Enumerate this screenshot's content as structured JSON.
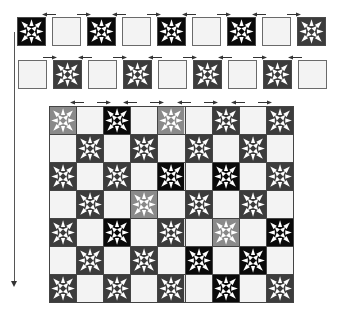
{
  "colors": {
    "black": "#0a0a0a",
    "dark": "#3c3c3c",
    "light": "#8a8a8a",
    "blank": "#f3f3f3",
    "star": "#ffffff",
    "arrow": "#333333"
  },
  "strip_row_1": {
    "top": 17,
    "blocks": [
      {
        "x": 17,
        "type": "star",
        "shade": "black"
      },
      {
        "x": 52,
        "type": "blank"
      },
      {
        "x": 87,
        "type": "star",
        "shade": "black"
      },
      {
        "x": 122,
        "type": "blank"
      },
      {
        "x": 157,
        "type": "star",
        "shade": "black"
      },
      {
        "x": 192,
        "type": "blank"
      },
      {
        "x": 227,
        "type": "star",
        "shade": "black"
      },
      {
        "x": 262,
        "type": "blank"
      },
      {
        "x": 297,
        "type": "star",
        "shade": "dark"
      }
    ],
    "arrows": [
      {
        "x": 42,
        "dir": "left"
      },
      {
        "x": 77,
        "dir": "right"
      },
      {
        "x": 112,
        "dir": "left"
      },
      {
        "x": 147,
        "dir": "right"
      },
      {
        "x": 182,
        "dir": "left"
      },
      {
        "x": 217,
        "dir": "right"
      },
      {
        "x": 252,
        "dir": "left"
      },
      {
        "x": 287,
        "dir": "right"
      }
    ],
    "arrow_top": 12
  },
  "strip_row_2": {
    "top": 60,
    "blocks": [
      {
        "x": 18,
        "type": "blank"
      },
      {
        "x": 53,
        "type": "star",
        "shade": "dark"
      },
      {
        "x": 88,
        "type": "blank"
      },
      {
        "x": 123,
        "type": "star",
        "shade": "dark"
      },
      {
        "x": 158,
        "type": "blank"
      },
      {
        "x": 193,
        "type": "star",
        "shade": "dark"
      },
      {
        "x": 228,
        "type": "blank"
      },
      {
        "x": 263,
        "type": "star",
        "shade": "dark"
      },
      {
        "x": 298,
        "type": "blank"
      }
    ],
    "arrows": [
      {
        "x": 43,
        "dir": "right"
      },
      {
        "x": 78,
        "dir": "left"
      },
      {
        "x": 113,
        "dir": "right"
      },
      {
        "x": 148,
        "dir": "left"
      },
      {
        "x": 183,
        "dir": "right"
      },
      {
        "x": 218,
        "dir": "left"
      },
      {
        "x": 253,
        "dir": "right"
      },
      {
        "x": 288,
        "dir": "left"
      }
    ],
    "arrow_top": 55
  },
  "quilt_grid": {
    "columns": 9,
    "rows": 7,
    "arrow_top": 100,
    "arrows": [
      {
        "x": 70,
        "dir": "left"
      },
      {
        "x": 97,
        "dir": "right"
      },
      {
        "x": 123,
        "dir": "left"
      },
      {
        "x": 150,
        "dir": "right"
      },
      {
        "x": 177,
        "dir": "left"
      },
      {
        "x": 204,
        "dir": "right"
      },
      {
        "x": 231,
        "dir": "left"
      },
      {
        "x": 258,
        "dir": "right"
      }
    ],
    "cells": [
      [
        "light",
        null,
        "black",
        null,
        "light",
        null,
        "dark",
        null,
        "dark"
      ],
      [
        null,
        "dark",
        null,
        "dark",
        null,
        "dark",
        null,
        "dark",
        null
      ],
      [
        "dark",
        null,
        "dark",
        null,
        "black",
        null,
        "black",
        null,
        "dark"
      ],
      [
        null,
        "dark",
        null,
        "light",
        null,
        "dark",
        null,
        "dark",
        null
      ],
      [
        "dark",
        null,
        "black",
        null,
        "dark",
        null,
        "light",
        null,
        "black"
      ],
      [
        null,
        "dark",
        null,
        "dark",
        null,
        "black",
        null,
        "black",
        null
      ],
      [
        "dark",
        null,
        "dark",
        null,
        "dark",
        null,
        "black",
        null,
        "dark"
      ]
    ]
  },
  "vertical_arrow": {
    "x": 14,
    "top": 32,
    "bottom": 287,
    "dir": "down"
  }
}
